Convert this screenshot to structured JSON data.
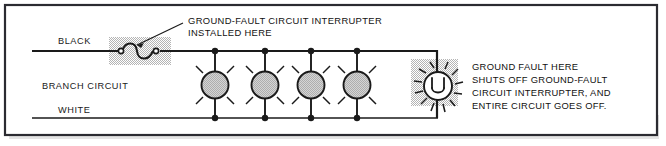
{
  "figure": {
    "border_color": "#2b2b31",
    "background_color": "#ffffff",
    "wire_color": "#1a1a1a",
    "shade_color": "#cfcfcf",
    "lamp_fill": "#c8c8c8",
    "text_color": "#111111"
  },
  "labels": {
    "black_wire": "BLACK",
    "branch_circuit": "BRANCH CIRCUIT",
    "white_wire": "WHITE"
  },
  "callout": {
    "line1": "GROUND-FAULT CIRCUIT INTERRUPTER",
    "line2": "INSTALLED HERE"
  },
  "note": {
    "line1": "GROUND FAULT HERE",
    "line2": "SHUTS OFF GROUND-FAULT",
    "line3": "CIRCUIT INTERRUPTER, AND",
    "line4": "ENTIRE CIRCUIT GOES OFF."
  },
  "symbols": {
    "gfci_switch": "gfci-switch-symbol",
    "fault_burst": "ground-fault-burst-symbol",
    "lamp": "lamp-symbol"
  },
  "lamps": [
    {
      "name": "lamp-1",
      "cx": 215
    },
    {
      "name": "lamp-2",
      "cx": 265
    },
    {
      "name": "lamp-3",
      "cx": 311
    },
    {
      "name": "lamp-4",
      "cx": 357
    }
  ]
}
